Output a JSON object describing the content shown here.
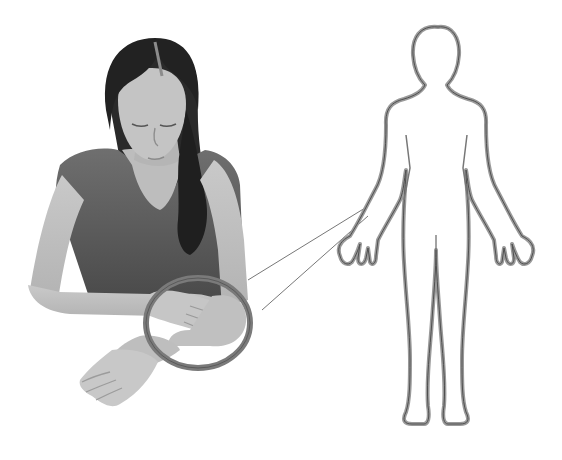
{
  "figure": {
    "background_color": "#ffffff",
    "photo": {
      "subject": "woman seated at table, arms crossed resting, head bowed",
      "tone": "grayscale"
    },
    "highlight_ring": {
      "target_region": "forearm / elbow",
      "color": "#7a7a7a",
      "center": [
        198,
        335
      ],
      "rx": 52,
      "ry": 45
    },
    "callout_lines": {
      "color": "#777777",
      "count": 2
    },
    "body_outline": {
      "view": "anterior, arms at sides, palms forward",
      "stroke_outer": "#9a9a9a",
      "stroke_inner": "#555555"
    }
  }
}
